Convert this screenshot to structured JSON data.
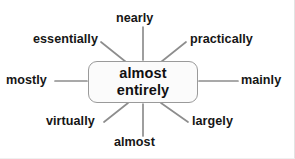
{
  "diagram": {
    "type": "mind-map",
    "center": {
      "id": "center-node",
      "lines": [
        "almost",
        "entirely"
      ],
      "text": "almost entirely"
    },
    "colors": {
      "background": "#ffffff",
      "node_fill": "#fbfbfb",
      "node_border": "#9a9a9a",
      "spoke": "#8d8d8d",
      "text": "#161616"
    },
    "branches": [
      {
        "id": "nearly",
        "label": "nearly",
        "direction": "top"
      },
      {
        "id": "practically",
        "label": "practically",
        "direction": "top-right"
      },
      {
        "id": "mainly",
        "label": "mainly",
        "direction": "right"
      },
      {
        "id": "largely",
        "label": "largely",
        "direction": "bottom-right"
      },
      {
        "id": "almost",
        "label": "almost",
        "direction": "bottom"
      },
      {
        "id": "virtually",
        "label": "virtually",
        "direction": "bottom-left"
      },
      {
        "id": "mostly",
        "label": "mostly",
        "direction": "left"
      },
      {
        "id": "essentially",
        "label": "essentially",
        "direction": "top-left"
      }
    ]
  }
}
